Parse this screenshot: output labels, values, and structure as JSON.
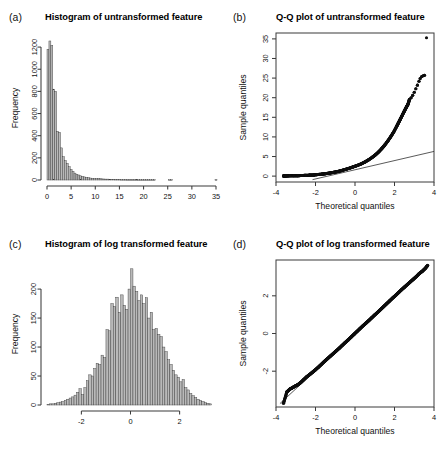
{
  "figure": {
    "background": "#ffffff",
    "bar_fill": "#b9b9b9",
    "bar_stroke": "#3a3a3a",
    "point_color": "#0d0d0d",
    "axis_color": "#3b3b3b"
  },
  "panels": [
    {
      "tag": "(a)",
      "title": "Histogram of untransformed feature"
    },
    {
      "tag": "(b)",
      "title": "Q-Q plot of untransformed feature"
    },
    {
      "tag": "(c)",
      "title": "Histogram of log transformed feature"
    },
    {
      "tag": "(d)",
      "title": "Q-Q plot of log transformed feature"
    }
  ],
  "chart_data": [
    {
      "type": "bar",
      "panel": "a",
      "title": "Histogram of untransformed feature",
      "xlabel": "",
      "ylabel": "Frequency",
      "xlim": [
        0,
        35
      ],
      "ylim": [
        0,
        1300
      ],
      "xticks": [
        0,
        5,
        10,
        15,
        20,
        25,
        30,
        35
      ],
      "yticks": [
        0,
        200,
        400,
        600,
        800,
        1000,
        1200
      ],
      "grid": false,
      "legend": null,
      "bin_width": 0.4,
      "bin_starts": [
        0.0,
        0.4,
        0.8,
        1.2,
        1.6,
        2.0,
        2.4,
        2.8,
        3.2,
        3.6,
        4.0,
        4.4,
        4.8,
        5.2,
        5.6,
        6.0,
        6.4,
        6.8,
        7.2,
        7.6,
        8.0,
        8.4,
        8.8,
        9.2,
        9.6,
        10.0,
        10.4,
        10.8,
        11.2,
        11.6,
        12.0,
        12.4,
        12.8,
        13.2,
        13.6,
        14.0,
        14.4,
        14.8,
        15.2,
        15.6,
        16.0,
        16.4,
        16.8,
        17.2,
        17.6,
        18.0,
        18.4,
        18.8,
        19.2,
        19.6,
        20.0,
        20.4,
        20.8,
        21.2,
        21.6,
        22.0,
        25.2,
        25.6,
        34.8
      ],
      "values": [
        1180,
        1255,
        1215,
        820,
        800,
        440,
        430,
        290,
        210,
        175,
        150,
        120,
        95,
        78,
        62,
        52,
        45,
        38,
        33,
        28,
        24,
        21,
        18,
        16,
        14,
        13,
        12,
        11,
        10,
        9,
        8,
        8,
        7,
        6,
        6,
        5,
        5,
        5,
        4,
        4,
        4,
        3,
        3,
        3,
        3,
        3,
        2,
        2,
        2,
        2,
        2,
        2,
        2,
        2,
        2,
        2,
        2,
        2,
        2
      ]
    },
    {
      "type": "scatter",
      "panel": "b",
      "title": "Q-Q plot of untransformed feature",
      "xlabel": "Theoretical quantiles",
      "ylabel": "Sample quantiles",
      "xlim": [
        -4,
        4
      ],
      "ylim": [
        -1.5,
        36.5
      ],
      "xticks": [
        -4,
        -2,
        0,
        2,
        4
      ],
      "yticks": [
        0,
        5,
        10,
        15,
        20,
        25,
        30,
        35
      ],
      "grid": false,
      "legend": null,
      "reference_line": {
        "x": [
          -2.15,
          4.0
        ],
        "y": [
          -0.9,
          6.3
        ]
      },
      "x": [
        -3.62,
        -3.52,
        -3.3,
        -3.1,
        -2.9,
        -2.7,
        -2.5,
        -2.3,
        -2.1,
        -1.9,
        -1.7,
        -1.5,
        -1.3,
        -1.1,
        -0.9,
        -0.7,
        -0.5,
        -0.3,
        -0.1,
        0.1,
        0.3,
        0.5,
        0.7,
        0.9,
        1.05,
        1.2,
        1.35,
        1.5,
        1.65,
        1.8,
        1.95,
        2.1,
        2.2,
        2.3,
        2.4,
        2.5,
        2.6,
        2.68,
        2.76,
        2.84,
        2.92,
        3.0,
        3.08,
        3.16,
        3.24,
        3.3,
        3.38,
        3.45,
        3.52,
        3.62
      ],
      "y": [
        0.05,
        0.05,
        0.08,
        0.1,
        0.12,
        0.15,
        0.2,
        0.25,
        0.3,
        0.4,
        0.5,
        0.62,
        0.78,
        0.95,
        1.15,
        1.4,
        1.7,
        2.0,
        2.35,
        2.7,
        3.1,
        3.6,
        4.2,
        4.9,
        5.5,
        6.2,
        7.0,
        7.9,
        8.9,
        10.0,
        11.2,
        12.6,
        13.6,
        14.6,
        15.6,
        16.6,
        17.6,
        18.3,
        19.6,
        20.0,
        20.6,
        21.4,
        22.3,
        23.2,
        24.2,
        24.9,
        25.4,
        25.6,
        25.7,
        35.3
      ]
    },
    {
      "type": "bar",
      "panel": "c",
      "title": "Histogram of log transformed feature",
      "xlabel": "",
      "ylabel": "Frequency",
      "xlim": [
        -3.4,
        3.4
      ],
      "ylim": [
        0,
        245
      ],
      "xticks": [
        -2,
        0,
        2
      ],
      "yticks": [
        0,
        50,
        100,
        150,
        200
      ],
      "grid": false,
      "legend": null,
      "bin_width": 0.1,
      "bin_starts": [
        -3.4,
        -3.3,
        -3.2,
        -3.1,
        -3.0,
        -2.9,
        -2.8,
        -2.7,
        -2.6,
        -2.5,
        -2.4,
        -2.3,
        -2.2,
        -2.1,
        -2.0,
        -1.9,
        -1.8,
        -1.7,
        -1.6,
        -1.5,
        -1.4,
        -1.3,
        -1.2,
        -1.1,
        -1.0,
        -0.9,
        -0.8,
        -0.7,
        -0.6,
        -0.5,
        -0.4,
        -0.3,
        -0.2,
        -0.1,
        0.0,
        0.1,
        0.2,
        0.3,
        0.4,
        0.5,
        0.6,
        0.7,
        0.8,
        0.9,
        1.0,
        1.1,
        1.2,
        1.3,
        1.4,
        1.5,
        1.6,
        1.7,
        1.8,
        1.9,
        2.0,
        2.1,
        2.2,
        2.3,
        2.4,
        2.5,
        2.6,
        2.7,
        2.8,
        2.9,
        3.0,
        3.1,
        3.2
      ],
      "values": [
        1,
        2,
        2,
        3,
        4,
        5,
        6,
        8,
        10,
        12,
        14,
        17,
        22,
        28,
        18,
        30,
        42,
        52,
        50,
        63,
        72,
        70,
        86,
        82,
        130,
        128,
        175,
        170,
        186,
        160,
        190,
        172,
        165,
        200,
        235,
        205,
        196,
        180,
        190,
        175,
        185,
        150,
        160,
        130,
        132,
        122,
        118,
        100,
        92,
        78,
        70,
        60,
        52,
        48,
        40,
        44,
        30,
        26,
        20,
        16,
        13,
        10,
        8,
        6,
        4,
        3,
        2
      ]
    },
    {
      "type": "scatter",
      "panel": "d",
      "title": "Q-Q plot of log transformed feature",
      "xlabel": "Theoretical quantiles",
      "ylabel": "Sample quantiles",
      "xlim": [
        -4,
        4
      ],
      "ylim": [
        -3.9,
        3.9
      ],
      "xticks": [
        -4,
        -2,
        0,
        2,
        4
      ],
      "yticks": [
        -2,
        0,
        2
      ],
      "grid": false,
      "legend": null,
      "reference_line": {
        "x": [
          -3.8,
          3.75
        ],
        "y": [
          -3.72,
          3.62
        ]
      },
      "x": [
        -3.62,
        -3.45,
        -3.3,
        -3.18,
        -3.05,
        -2.9,
        -2.75,
        -2.6,
        -2.45,
        -2.3,
        -2.15,
        -2.0,
        -1.85,
        -1.7,
        -1.55,
        -1.4,
        -1.25,
        -1.1,
        -0.95,
        -0.8,
        -0.65,
        -0.5,
        -0.35,
        -0.2,
        -0.05,
        0.1,
        0.25,
        0.4,
        0.55,
        0.7,
        0.85,
        1.0,
        1.15,
        1.3,
        1.45,
        1.6,
        1.75,
        1.9,
        2.05,
        2.2,
        2.35,
        2.5,
        2.65,
        2.8,
        2.95,
        3.1,
        3.25,
        3.4,
        3.55,
        3.68
      ],
      "y": [
        -3.7,
        -3.1,
        -2.95,
        -2.88,
        -2.8,
        -2.72,
        -2.6,
        -2.45,
        -2.3,
        -2.18,
        -2.05,
        -1.92,
        -1.78,
        -1.63,
        -1.48,
        -1.34,
        -1.2,
        -1.06,
        -0.92,
        -0.78,
        -0.63,
        -0.48,
        -0.34,
        -0.19,
        -0.04,
        0.11,
        0.26,
        0.41,
        0.55,
        0.69,
        0.84,
        0.99,
        1.13,
        1.28,
        1.43,
        1.58,
        1.73,
        1.88,
        2.02,
        2.17,
        2.32,
        2.46,
        2.6,
        2.74,
        2.88,
        3.02,
        3.18,
        3.3,
        3.45,
        3.62
      ]
    }
  ]
}
